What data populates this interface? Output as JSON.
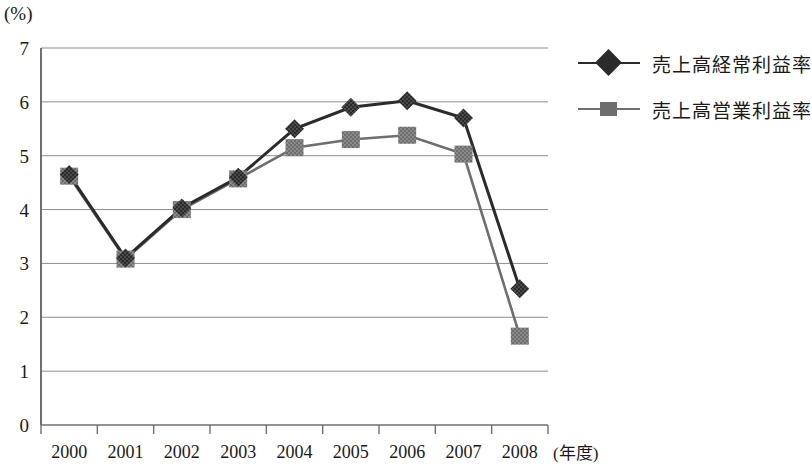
{
  "chart_data": {
    "type": "line",
    "title": "",
    "subtitle": "",
    "xlabel": "(年度)",
    "ylabel": "(%)",
    "unit_label": "(%)",
    "categories": [
      "2000",
      "2001",
      "2002",
      "2003",
      "2004",
      "2005",
      "2006",
      "2007",
      "2008"
    ],
    "x": [
      2000,
      2001,
      2002,
      2003,
      2004,
      2005,
      2006,
      2007,
      2008
    ],
    "ylim": [
      0,
      7
    ],
    "yticks": [
      0,
      1,
      2,
      3,
      4,
      5,
      6,
      7
    ],
    "ytick_labels": [
      "0",
      "1",
      "2",
      "3",
      "4",
      "5",
      "6",
      "7"
    ],
    "grid": true,
    "legend_position": "right",
    "series": [
      {
        "name": "売上高経常利益率",
        "marker": "diamond",
        "color": "#2b2b2b",
        "values": [
          4.65,
          3.1,
          4.03,
          4.6,
          5.5,
          5.9,
          6.02,
          5.7,
          2.53
        ]
      },
      {
        "name": "売上高営業利益率",
        "marker": "square",
        "color": "#6e6e6e",
        "values": [
          4.62,
          3.08,
          4.0,
          4.57,
          5.15,
          5.3,
          5.38,
          5.03,
          1.65
        ]
      }
    ]
  },
  "legend": {
    "items": [
      {
        "label": "売上高経常利益率",
        "marker": "diamond",
        "color": "#2b2b2b"
      },
      {
        "label": "売上高営業利益率",
        "marker": "square",
        "color": "#6e6e6e"
      }
    ]
  },
  "axes": {
    "y_unit": "(%)",
    "x_caption": "(年度)"
  }
}
